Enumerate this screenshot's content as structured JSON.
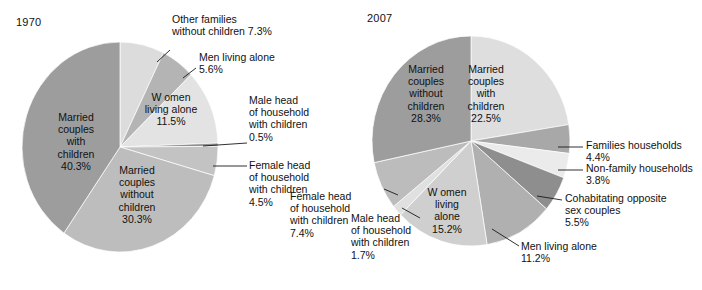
{
  "figure": {
    "background": "#ffffff",
    "text_color": "#111111"
  },
  "panels": [
    {
      "id": "panel-1970",
      "year_label": "1970"
    },
    {
      "id": "panel-2007",
      "year_label": "2007"
    }
  ],
  "labels_1970": {
    "married_with": "Married\ncouples\nwith\nchildren\n40.3%",
    "married_without": "Married\ncouples\nwithout\nchildren\n30.3%",
    "women_alone": "W omen\nliving alone\n11.5%",
    "other_families": "Other families\nwithout children 7.3%",
    "men_alone": "Men living alone\n5.6%",
    "male_head": "Male head\nof household\nwith children\n0.5%",
    "female_head": "Female head\nof household\nwith children\n4.5%"
  },
  "labels_2007": {
    "married_without": "Married\ncouples\nwithout\nchildren\n28.3%",
    "married_with": "Married\ncouples\nwith\nchildren\n22.5%",
    "women_alone": "W omen\nliving\nalone\n15.2%",
    "families_households": "Families households\n4.4%",
    "nonfamily_households": "Non-family households\n3.8%",
    "cohabitating": "Cohabitating opposite\nsex couples\n5.5%",
    "men_alone": "Men living alone\n11.2%",
    "female_head": "Female head\nof household\nwith children\n7.4%",
    "male_head": "Male head\nof household\nwith children\n1.7%"
  },
  "chart_data": [
    {
      "type": "pie",
      "title": "1970",
      "id": "pie-1970",
      "start_angle_deg": 0,
      "direction": "clockwise",
      "center": [
        120,
        147
      ],
      "radius": [
        98,
        105
      ],
      "legend_position": "callout-labels",
      "categories": [
        "Other families without children",
        "Men living alone",
        "Women living alone",
        "Male head of household with children",
        "Female head of household with children",
        "Married couples without children",
        "Married couples with children"
      ],
      "values": [
        7.3,
        5.6,
        11.5,
        0.5,
        4.5,
        30.3,
        40.3
      ],
      "colors": [
        "#dcdcdc",
        "#b4b4b4",
        "#e3e3e3",
        "#8f8f8f",
        "#c3c3c3",
        "#bdbdbd",
        "#9d9d9d"
      ],
      "labels": [
        "7.3%",
        "5.6%",
        "11.5%",
        "0.5%",
        "4.5%",
        "30.3%",
        "40.3%"
      ]
    },
    {
      "type": "pie",
      "title": "2007",
      "id": "pie-2007",
      "start_angle_deg": 0,
      "direction": "clockwise",
      "center": [
        471,
        141
      ],
      "radius": [
        99,
        105
      ],
      "legend_position": "callout-labels",
      "categories": [
        "Married couples with children",
        "Families households",
        "Non-family households",
        "Cohabitating opposite sex couples",
        "Men living alone",
        "Women living alone",
        "Male head of household with children",
        "Female head of household with children",
        "Married couples without children"
      ],
      "values": [
        22.5,
        4.4,
        3.8,
        5.5,
        11.2,
        15.2,
        1.7,
        7.4,
        28.3
      ],
      "colors": [
        "#dedede",
        "#a8a8a8",
        "#ebebeb",
        "#8e8e8e",
        "#b0b0b0",
        "#cfcfcf",
        "#e0e0e0",
        "#bcbcbc",
        "#9d9d9d"
      ],
      "labels": [
        "22.5%",
        "4.4%",
        "3.8%",
        "5.5%",
        "11.2%",
        "15.2%",
        "1.7%",
        "7.4%",
        "28.3%"
      ]
    }
  ]
}
